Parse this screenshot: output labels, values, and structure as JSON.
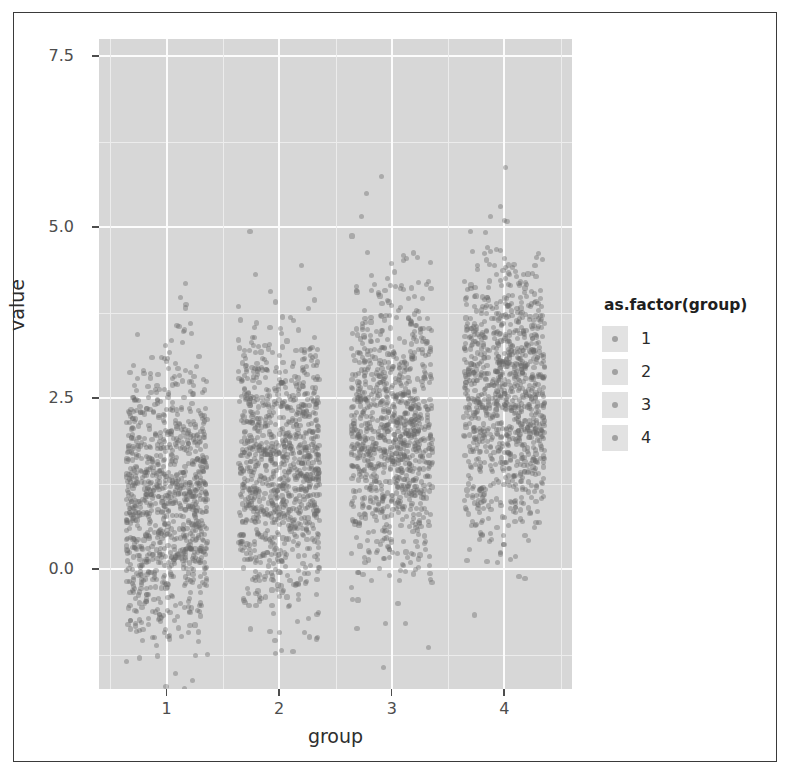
{
  "chart_data": {
    "type": "scatter",
    "plot_style": "jitter-strip-plot",
    "title": "",
    "xlabel": "group",
    "ylabel": "value",
    "xlim": [
      0.4,
      4.6
    ],
    "ylim": [
      -1.75,
      7.75
    ],
    "grid": true,
    "panel_background": "#d7d7d7",
    "gridline_color": "#fcfcfc",
    "minor_gridline_color": "#ececec",
    "point_color": "#6b6b6b",
    "legend_position": "right",
    "legend_title": "as.factor(group)",
    "legend_entries": [
      "1",
      "2",
      "3",
      "4"
    ],
    "x_ticks": [
      1,
      2,
      3,
      4
    ],
    "x_tick_labels": [
      "1",
      "2",
      "3",
      "4"
    ],
    "y_ticks": [
      0.0,
      2.5,
      5.0,
      7.5
    ],
    "y_tick_labels": [
      "0.0",
      "2.5",
      "5.0",
      "7.5"
    ],
    "y_minor_ticks": [
      -1.25,
      1.25,
      3.75,
      6.25
    ],
    "categories": [
      "1",
      "2",
      "3",
      "4"
    ],
    "series": [
      {
        "name": "1",
        "n": 1000,
        "mean": 1.0,
        "sd": 1.0,
        "min": -1.65,
        "q1": 0.35,
        "median": 1.02,
        "q3": 1.7,
        "max": 4.6,
        "color": "#6b6b6b"
      },
      {
        "name": "2",
        "n": 1000,
        "mean": 1.5,
        "sd": 1.0,
        "min": -1.3,
        "q1": 0.85,
        "median": 1.5,
        "q3": 2.2,
        "max": 5.6,
        "color": "#6b6b6b"
      },
      {
        "name": "3",
        "n": 1000,
        "mean": 2.0,
        "sd": 1.0,
        "min": -0.05,
        "q1": 1.35,
        "median": 2.0,
        "q3": 2.7,
        "max": 5.85,
        "color": "#6b6b6b"
      },
      {
        "name": "4",
        "n": 1000,
        "mean": 2.5,
        "sd": 1.0,
        "min": 0.55,
        "q1": 1.85,
        "median": 2.5,
        "q3": 3.2,
        "max": 7.4,
        "color": "#6b6b6b"
      }
    ]
  },
  "axes": {
    "y_label": "value",
    "x_label": "group",
    "y_ticks": [
      "7.5",
      "5.0",
      "2.5",
      "0.0"
    ],
    "x_ticks": [
      "1",
      "2",
      "3",
      "4"
    ]
  },
  "legend": {
    "title": "as.factor(group)",
    "items": [
      {
        "label": "1"
      },
      {
        "label": "2"
      },
      {
        "label": "3"
      },
      {
        "label": "4"
      }
    ]
  }
}
